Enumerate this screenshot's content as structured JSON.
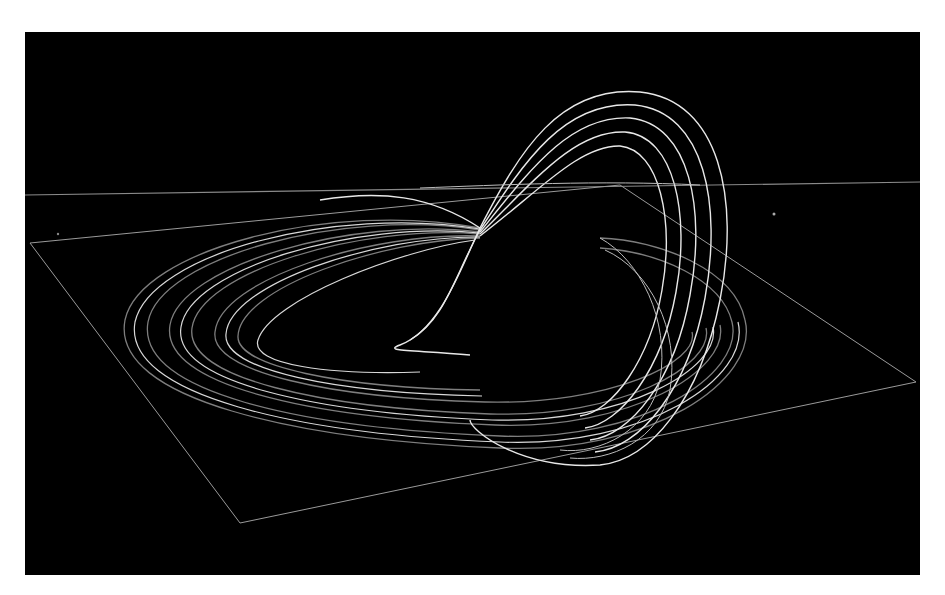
{
  "image": {
    "description": "3D rendering of a chaotic strange attractor (twisted loop band) above a wireframe plane on black background",
    "colors": {
      "background": "#000000",
      "border": "#ffffff",
      "curves": "#e8e8e8",
      "plane": "#9a9a9a"
    }
  }
}
